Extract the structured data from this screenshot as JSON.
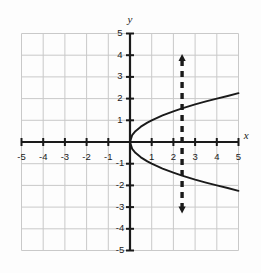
{
  "figure": {
    "background_color": "#fdfdfd",
    "grid_color": "#c9c9c9",
    "axis_color": "#1a1a1a",
    "curve_color": "#1a1a1a",
    "dashed_line_color": "#1a1a1a"
  },
  "axes": {
    "x_name": "x",
    "y_name": "y",
    "x_name_position": {
      "x": 5.35,
      "y": 0.25
    },
    "y_name_position": {
      "x": 0.0,
      "y": 5.6
    },
    "xlim": [
      -5,
      5
    ],
    "ylim": [
      -5,
      5
    ],
    "grid": true,
    "grid_step": 1,
    "tick_step": 1
  },
  "labels": {
    "x_ticks": [
      {
        "value": -5,
        "text": "-5"
      },
      {
        "value": -4,
        "text": "-4"
      },
      {
        "value": -3,
        "text": "-3"
      },
      {
        "value": -2,
        "text": "-2"
      },
      {
        "value": -1,
        "text": "-1"
      },
      {
        "value": 1,
        "text": "1"
      },
      {
        "value": 2,
        "text": "2"
      },
      {
        "value": 3,
        "text": "3"
      },
      {
        "value": 4,
        "text": "4"
      },
      {
        "value": 5,
        "text": "5"
      }
    ],
    "y_ticks": [
      {
        "value": 5,
        "text": "5"
      },
      {
        "value": 4,
        "text": "4"
      },
      {
        "value": 3,
        "text": "3"
      },
      {
        "value": 2,
        "text": "2"
      },
      {
        "value": 1,
        "text": "1"
      },
      {
        "value": -1,
        "text": "-1"
      },
      {
        "value": -2,
        "text": "-2"
      },
      {
        "value": -3,
        "text": "-3"
      },
      {
        "value": -4,
        "text": "-4"
      },
      {
        "value": -5,
        "text": "-5"
      }
    ]
  },
  "chart_data": {
    "type": "line",
    "title": "",
    "xlabel": "x",
    "ylabel": "y",
    "xlim": [
      -5,
      5
    ],
    "ylim": [
      -5,
      5
    ],
    "grid": true,
    "legend": "none",
    "series": [
      {
        "name": "sideways-parabola-upper-branch",
        "equation": "x = y^2, y >= 0",
        "style": "solid",
        "color": "#1a1a1a",
        "x": [
          0,
          0.1,
          0.25,
          0.5,
          0.8,
          1,
          1.5,
          2,
          2.4,
          3,
          3.5,
          4,
          4.5,
          5
        ],
        "y": [
          0,
          0.316,
          0.5,
          0.707,
          0.894,
          1,
          1.225,
          1.414,
          1.549,
          1.732,
          1.871,
          2,
          2.121,
          2.25
        ]
      },
      {
        "name": "sideways-parabola-lower-branch",
        "equation": "x = y^2, y <= 0",
        "style": "solid",
        "color": "#1a1a1a",
        "x": [
          0,
          0.1,
          0.25,
          0.5,
          0.8,
          1,
          1.5,
          2,
          2.4,
          3,
          3.5,
          4,
          4.5,
          5
        ],
        "y": [
          0,
          -0.316,
          -0.5,
          -0.707,
          -0.894,
          -1,
          -1.225,
          -1.414,
          -1.549,
          -1.732,
          -1.871,
          -2,
          -2.121,
          -2.25
        ]
      },
      {
        "name": "vertical-test-line",
        "equation": "x = 2.4",
        "style": "dashed",
        "color": "#1a1a1a",
        "arrowheads": "both",
        "x": [
          2.4,
          2.4
        ],
        "y": [
          -3.3,
          4.05
        ]
      }
    ],
    "annotations": [
      {
        "name": "vertex",
        "x": 0,
        "y": 0
      },
      {
        "name": "intersection-upper",
        "x": 2.4,
        "y": 1.55
      },
      {
        "name": "intersection-lower",
        "x": 2.4,
        "y": -1.55
      }
    ]
  }
}
